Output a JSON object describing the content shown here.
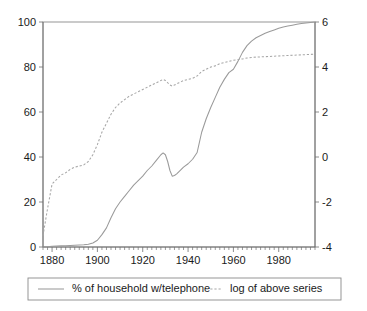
{
  "chart_data": {
    "type": "line",
    "title": "",
    "subtitle": "",
    "xlabel": "",
    "ylabel": "",
    "y2label": "",
    "grid": false,
    "legend_position": "bottom",
    "xlim": [
      1876,
      1996
    ],
    "xticks": [
      1880,
      1900,
      1920,
      1940,
      1960,
      1980
    ],
    "xticklabels": [
      "1880",
      "1900",
      "1920",
      "1940",
      "1960",
      "1980"
    ],
    "x_minor_tick_step": 2,
    "ylim": [
      0,
      100
    ],
    "yticks": [
      0,
      20,
      40,
      60,
      80,
      100
    ],
    "yticklabels": [
      "0",
      "20",
      "40",
      "60",
      "80",
      "100"
    ],
    "y2lim": [
      -4,
      6
    ],
    "y2ticks": [
      -4,
      -2,
      0,
      2,
      4,
      6
    ],
    "y2ticklabels": [
      "-4",
      "-2",
      "0",
      "2",
      "4",
      "6"
    ],
    "x": [
      1876,
      1878,
      1880,
      1882,
      1884,
      1886,
      1888,
      1890,
      1892,
      1894,
      1896,
      1898,
      1900,
      1902,
      1904,
      1906,
      1908,
      1910,
      1912,
      1914,
      1916,
      1918,
      1920,
      1922,
      1924,
      1926,
      1928,
      1929,
      1930,
      1931,
      1932,
      1933,
      1934,
      1935,
      1936,
      1937,
      1938,
      1940,
      1942,
      1944,
      1945,
      1946,
      1948,
      1950,
      1952,
      1954,
      1956,
      1958,
      1960,
      1962,
      1964,
      1966,
      1968,
      1970,
      1972,
      1974,
      1976,
      1978,
      1980,
      1982,
      1984,
      1986,
      1988,
      1990,
      1992,
      1994,
      1996
    ],
    "series": [
      {
        "name": "% of household w/telephone",
        "style": "solid",
        "color": "#9a9a9a",
        "axis": "left",
        "values": [
          0.03,
          0.1,
          0.3,
          0.4,
          0.5,
          0.6,
          0.7,
          0.8,
          0.9,
          1.0,
          1.2,
          1.8,
          3.0,
          5.5,
          8.5,
          13.0,
          17.0,
          20.0,
          22.5,
          25.0,
          27.5,
          29.5,
          31.5,
          34.0,
          36.0,
          38.5,
          41.0,
          41.8,
          41.0,
          38.0,
          34.0,
          31.5,
          31.8,
          32.5,
          33.5,
          34.5,
          35.5,
          37.0,
          39.0,
          42.0,
          46.5,
          51.0,
          57.0,
          62.0,
          66.5,
          71.0,
          74.5,
          77.5,
          79.0,
          82.5,
          86.5,
          89.5,
          91.5,
          93.0,
          94.0,
          95.0,
          95.8,
          96.5,
          97.2,
          97.8,
          98.2,
          98.6,
          99.0,
          99.3,
          99.6,
          99.8,
          100.0
        ]
      },
      {
        "name": "log of above series",
        "style": "dashed",
        "color": "#a6a6a6",
        "axis": "right",
        "values": [
          -3.5,
          -2.3,
          -1.2,
          -1.0,
          -0.8,
          -0.7,
          -0.55,
          -0.45,
          -0.4,
          -0.35,
          -0.2,
          0.1,
          0.55,
          1.1,
          1.5,
          1.9,
          2.2,
          2.4,
          2.55,
          2.7,
          2.8,
          2.9,
          3.0,
          3.1,
          3.2,
          3.3,
          3.4,
          3.45,
          3.4,
          3.3,
          3.2,
          3.15,
          3.2,
          3.25,
          3.3,
          3.35,
          3.4,
          3.45,
          3.5,
          3.6,
          3.7,
          3.8,
          3.9,
          4.0,
          4.05,
          4.15,
          4.2,
          4.25,
          4.3,
          4.32,
          4.36,
          4.4,
          4.42,
          4.44,
          4.45,
          4.46,
          4.47,
          4.48,
          4.49,
          4.5,
          4.51,
          4.52,
          4.53,
          4.54,
          4.55,
          4.56,
          4.57
        ]
      }
    ],
    "annotations": []
  },
  "legend": {
    "items": [
      {
        "label": "% of household w/telephone",
        "style": "solid"
      },
      {
        "label": "log of above series",
        "style": "dashed"
      }
    ]
  }
}
